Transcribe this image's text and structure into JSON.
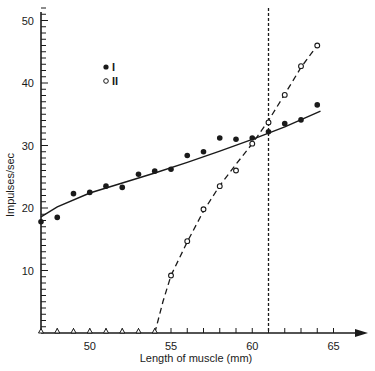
{
  "chart_data": {
    "type": "scatter",
    "title": "",
    "xlabel": "Length of muscle (mm)",
    "ylabel": "Impulses/sec",
    "xlim": [
      47,
      67
    ],
    "ylim": [
      0,
      52
    ],
    "xticks": [
      50,
      55,
      60,
      65
    ],
    "yticks": [
      10,
      20,
      30,
      40,
      50
    ],
    "grid": false,
    "legend": {
      "position": "upper-left",
      "entries": [
        {
          "label": "I",
          "marker": "filled-circle"
        },
        {
          "label": "II",
          "marker": "open-circle"
        }
      ]
    },
    "vertical_reference_line": {
      "x": 61,
      "style": "dashed"
    },
    "series": [
      {
        "name": "I",
        "marker": "filled-circle",
        "fit_line": "solid",
        "x": [
          47,
          48,
          49,
          50,
          51,
          52,
          53,
          54,
          55,
          56,
          57,
          58,
          59,
          60,
          61,
          62,
          63,
          64
        ],
        "y": [
          17.8,
          18.5,
          22.3,
          22.5,
          23.5,
          23.3,
          25.4,
          25.9,
          26.2,
          28.4,
          29.0,
          31.2,
          31.0,
          31.2,
          32.2,
          33.5,
          34.1,
          36.5
        ],
        "fit": {
          "x": [
            47,
            48,
            50,
            52,
            54,
            56,
            58,
            60,
            62,
            64.2
          ],
          "y": [
            18.6,
            20.2,
            22.4,
            24.0,
            25.6,
            27.3,
            29.1,
            31.0,
            33.0,
            35.5
          ]
        }
      },
      {
        "name": "II",
        "marker": "open-circle",
        "fit_line": "dashed",
        "x": [
          55,
          56,
          57,
          58,
          59,
          60,
          61,
          62,
          63,
          64
        ],
        "y": [
          9.2,
          14.7,
          19.8,
          23.5,
          26.0,
          30.3,
          33.7,
          38.1,
          42.7,
          46.0
        ],
        "fit": {
          "x": [
            54,
            54.5,
            55,
            56,
            57,
            58,
            59,
            60,
            61,
            62,
            63,
            64
          ],
          "y": [
            0,
            5,
            9.2,
            14.6,
            19.5,
            23.6,
            27.0,
            30.3,
            34.0,
            38.2,
            42.5,
            46.0
          ]
        }
      },
      {
        "name": "zero-response",
        "marker": "open-triangle",
        "x": [
          47,
          48,
          49,
          50,
          51,
          52,
          53,
          54
        ],
        "y": [
          0,
          0,
          0,
          0,
          0,
          0,
          0,
          0
        ]
      }
    ]
  }
}
